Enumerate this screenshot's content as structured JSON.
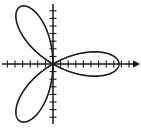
{
  "figure": {
    "background_color": "#ffffff",
    "stroke_color": "#1a1a1a",
    "width": 141,
    "height": 128,
    "caption": ""
  },
  "chart_data": {
    "type": "line",
    "subtype": "polar-rose",
    "title": "",
    "subtitle": "",
    "xlabel": "",
    "ylabel": "",
    "equation": "r = a cos(3θ)",
    "petal_count": 3,
    "petal_angles_deg": [
      0,
      120,
      240
    ],
    "grid": false,
    "legend": false,
    "legend_position": "none",
    "axes": {
      "origin_px": [
        53,
        64
      ],
      "x_axis": {
        "visible": true,
        "from_px": [
          2,
          64
        ],
        "to_px": [
          139,
          64
        ],
        "arrow_start": false,
        "arrow_end": true,
        "tick_spacing_px": 7.6,
        "tick_length_px": 7,
        "tick_count_positive": 11,
        "tick_count_negative": 6,
        "tick_labels": []
      },
      "y_axis": {
        "visible": true,
        "from_px": [
          53,
          4
        ],
        "to_px": [
          53,
          124
        ],
        "arrow_start": false,
        "arrow_end": false,
        "tick_spacing_px": 7.6,
        "tick_length_px": 7,
        "tick_count_positive": 7,
        "tick_count_negative": 7,
        "tick_labels": []
      }
    },
    "series": [
      {
        "name": "rose-curve",
        "color": "#1a1a1a",
        "line_width": 1.6,
        "closed": true,
        "amplitude_px": 66,
        "theta_range_deg": [
          0,
          360
        ],
        "description": "Three-petal polar rose; petals point right, upper-left and lower-left."
      }
    ],
    "annotations": []
  }
}
